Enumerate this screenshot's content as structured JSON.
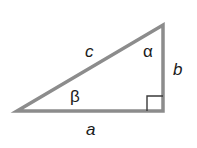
{
  "diagram": {
    "type": "right-triangle",
    "stroke_color": "#8c8c8c",
    "sides": {
      "hypotenuse": "c",
      "vertical": "b",
      "horizontal": "a"
    },
    "angles": {
      "top": "α",
      "left": "β"
    },
    "right_angle_marker": true
  }
}
